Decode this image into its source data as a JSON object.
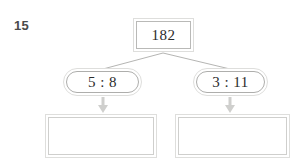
{
  "question": {
    "number": "15"
  },
  "diagram": {
    "type": "ratio-share-tree",
    "total_node": {
      "label": "182",
      "shape": "rectangle"
    },
    "ratio_nodes": [
      {
        "label": "5 : 8",
        "shape": "pill",
        "side": "left"
      },
      {
        "label": "3 : 11",
        "shape": "pill",
        "side": "right"
      }
    ],
    "answer_boxes": [
      {
        "label": "",
        "shape": "rectangle",
        "side": "left"
      },
      {
        "label": "",
        "shape": "rectangle",
        "side": "right"
      }
    ],
    "connectors": {
      "branch_lines": 2,
      "arrows": 2,
      "arrow_direction": "down"
    }
  },
  "colors": {
    "page_background": "#ffffff",
    "outer_border": "#dededc",
    "inner_border": "#b9b9b7",
    "answer_inner_border": "#cfcfcd",
    "node_fill": "#ffffff",
    "node_text": "#2b2b2b",
    "question_number_text": "#4a4a4a",
    "connector_line": "#b5b5b3",
    "arrow_fill": "#cfcfcd"
  }
}
